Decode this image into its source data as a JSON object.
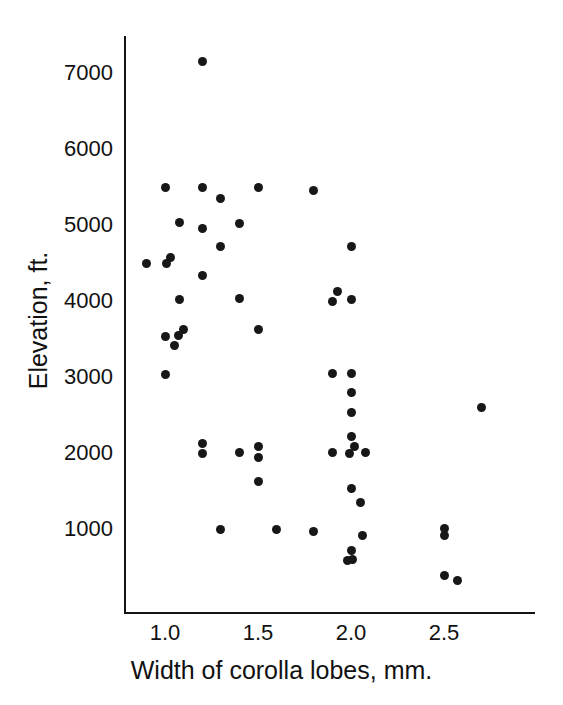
{
  "chart_data": {
    "type": "scatter",
    "title": "",
    "xlabel": "Width of corolla lobes, mm.",
    "ylabel": "Elevation, ft.",
    "xlim": [
      0.82,
      2.88
    ],
    "ylim": [
      130,
      7480
    ],
    "grid": false,
    "legend": null,
    "xticks": [
      1.0,
      1.5,
      2.0,
      2.5
    ],
    "xtick_labels": [
      "1.0",
      "1.5",
      "2.0",
      "2.5"
    ],
    "yticks": [
      1000,
      2000,
      3000,
      4000,
      5000,
      6000,
      7000
    ],
    "ytick_labels": [
      "1000",
      "2000",
      "3000",
      "4000",
      "5000",
      "6000",
      "7000"
    ],
    "marker": "filled-circle",
    "marker_color": "#171717",
    "n_points": 62,
    "points": [
      [
        1.2,
        7150
      ],
      [
        1.0,
        5500
      ],
      [
        1.2,
        5500
      ],
      [
        1.5,
        5500
      ],
      [
        1.8,
        5450
      ],
      [
        1.3,
        5350
      ],
      [
        1.08,
        5030
      ],
      [
        1.2,
        4960
      ],
      [
        1.4,
        5020
      ],
      [
        1.3,
        4720
      ],
      [
        2.0,
        4720
      ],
      [
        0.9,
        4500
      ],
      [
        1.01,
        4500
      ],
      [
        1.03,
        4570
      ],
      [
        1.2,
        4330
      ],
      [
        1.93,
        4120
      ],
      [
        1.08,
        4020
      ],
      [
        1.4,
        4030
      ],
      [
        1.9,
        4000
      ],
      [
        2.0,
        4020
      ],
      [
        1.1,
        3620
      ],
      [
        1.5,
        3620
      ],
      [
        1.0,
        3530
      ],
      [
        1.07,
        3540
      ],
      [
        1.05,
        3420
      ],
      [
        1.0,
        3030
      ],
      [
        1.9,
        3050
      ],
      [
        2.0,
        3050
      ],
      [
        2.0,
        2800
      ],
      [
        2.7,
        2600
      ],
      [
        2.0,
        2530
      ],
      [
        2.0,
        2220
      ],
      [
        1.2,
        2120
      ],
      [
        1.5,
        2090
      ],
      [
        2.02,
        2080
      ],
      [
        1.2,
        2000
      ],
      [
        1.4,
        2010
      ],
      [
        1.5,
        1940
      ],
      [
        1.9,
        2010
      ],
      [
        1.99,
        1990
      ],
      [
        2.08,
        2010
      ],
      [
        1.5,
        1620
      ],
      [
        2.0,
        1530
      ],
      [
        2.05,
        1350
      ],
      [
        1.3,
        1000
      ],
      [
        1.6,
        1000
      ],
      [
        1.8,
        970
      ],
      [
        2.5,
        1010
      ],
      [
        2.5,
        920
      ],
      [
        2.06,
        910
      ],
      [
        2.0,
        720
      ],
      [
        2.01,
        600
      ],
      [
        1.98,
        580
      ],
      [
        2.5,
        390
      ],
      [
        2.57,
        320
      ]
    ]
  },
  "figure": {
    "background_color": "#ffffff",
    "foreground_color": "#171717"
  }
}
